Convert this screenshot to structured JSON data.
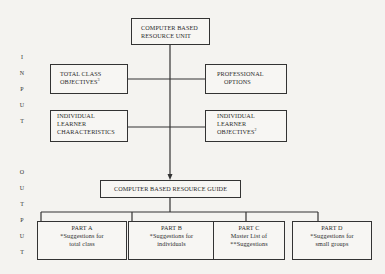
{
  "diagram": {
    "side_labels": {
      "input": [
        "I",
        "N",
        "P",
        "U",
        "T"
      ],
      "output": [
        "O",
        "U",
        "T",
        "P",
        "U",
        "T"
      ]
    },
    "top_box": {
      "line1": "COMPUTER BASED",
      "line2": "RESOURCE UNIT"
    },
    "total_class_objectives": {
      "line1": "TOTAL CLASS",
      "line2": "OBJECTIVES",
      "footnote": "3"
    },
    "professional_options": {
      "line1": "PROFESSIONAL",
      "line2": "OPTIONS"
    },
    "learner_characteristics": {
      "line1": "INDIVIDUAL",
      "line2": "LEARNER",
      "line3": "CHARACTERISTICS"
    },
    "learner_objectives": {
      "line1": "INDIVIDUAL",
      "line2": "LEARNER",
      "line3": "OBJECTIVES",
      "footnote": "2"
    },
    "guide_box": {
      "label": "COMPUTER BASED RESOURCE GUIDE"
    },
    "parts": [
      {
        "title": "PART A",
        "line1": "*Suggestions for",
        "line2": "total class"
      },
      {
        "title": "PART B",
        "line1": "*Suggestions for",
        "line2": "individuals"
      },
      {
        "title": "PART C",
        "line1": "Master List of",
        "line2": "**Suggestions"
      },
      {
        "title": "PART D",
        "line1": "*Suggestions for",
        "line2": "small groups"
      }
    ],
    "colors": {
      "background": "#f4f3f0",
      "line": "#333333"
    }
  }
}
